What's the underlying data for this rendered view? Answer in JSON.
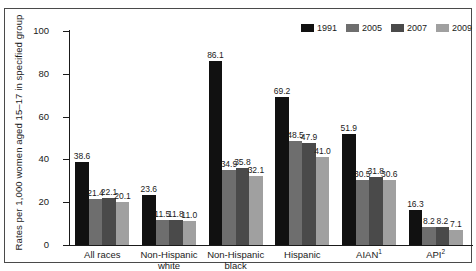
{
  "chart_data": {
    "type": "bar",
    "title": "",
    "xlabel": "",
    "ylabel": "Rates per 1,000 women aged 15–17 in specified group",
    "ylim": [
      0,
      100
    ],
    "yticks": [
      0,
      20,
      40,
      60,
      80,
      100
    ],
    "grid": false,
    "legend_position": "top-right",
    "categories": [
      "All races",
      "Non-Hispanic white",
      "Non-Hispanic black",
      "Hispanic",
      "AIAN",
      "API"
    ],
    "category_footnotes": [
      "",
      "",
      "",
      "",
      "1",
      "2"
    ],
    "series": [
      {
        "name": "1991",
        "color": "#111111",
        "values": [
          38.6,
          23.6,
          86.1,
          69.2,
          51.9,
          16.3
        ]
      },
      {
        "name": "2005",
        "color": "#6e6e6e",
        "values": [
          21.4,
          11.5,
          34.9,
          48.5,
          30.5,
          8.2
        ]
      },
      {
        "name": "2007",
        "color": "#4a4a4a",
        "values": [
          22.1,
          11.8,
          35.8,
          47.9,
          31.8,
          8.2
        ]
      },
      {
        "name": "2009",
        "color": "#a0a0a0",
        "values": [
          20.1,
          11.0,
          32.1,
          41.0,
          30.6,
          7.1
        ]
      }
    ]
  }
}
